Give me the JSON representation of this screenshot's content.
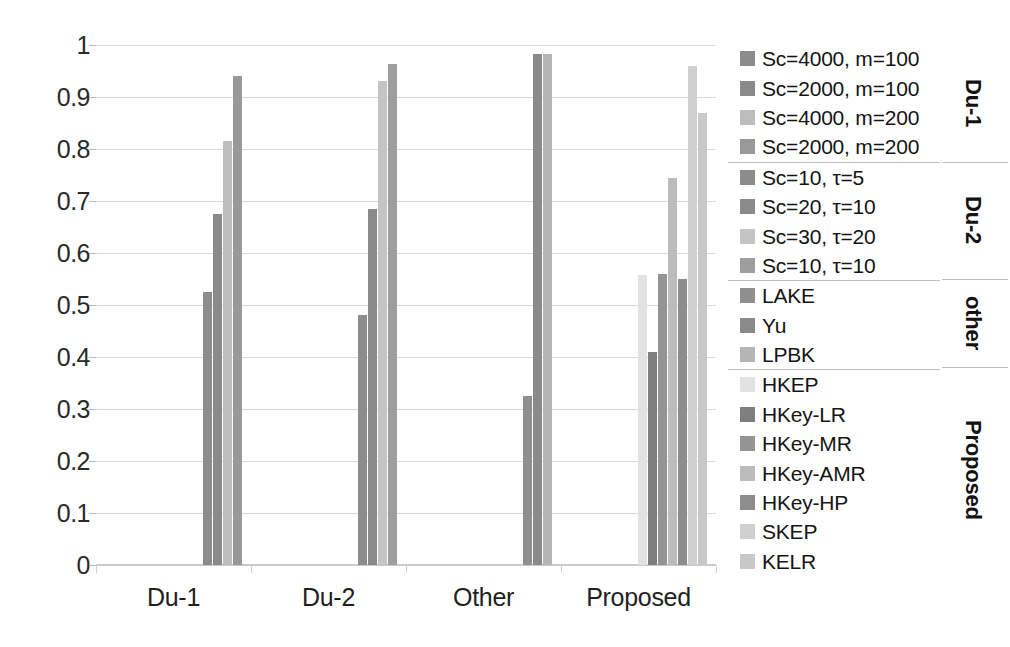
{
  "chart_data": {
    "type": "bar",
    "title": "",
    "xlabel": "",
    "ylabel": "",
    "ylim": [
      0,
      1
    ],
    "grid": true,
    "legend_position": "right",
    "categories": [
      "Du-1",
      "Du-2",
      "Other",
      "Proposed"
    ],
    "y_ticks": [
      "0",
      "0.1",
      "0.2",
      "0.3",
      "0.4",
      "0.5",
      "0.6",
      "0.7",
      "0.8",
      "0.9",
      "1"
    ],
    "y_tick_values": [
      0,
      0.1,
      0.2,
      0.3,
      0.4,
      0.5,
      0.6,
      0.7,
      0.8,
      0.9,
      1
    ],
    "series": [
      {
        "name": "Sc=4000, m=100",
        "group": "Du-1",
        "color": "#8c8c8c",
        "category": "Du-1",
        "value": 0.525
      },
      {
        "name": "Sc=2000, m=100",
        "group": "Du-1",
        "color": "#8a8a8a",
        "category": "Du-1",
        "value": 0.675
      },
      {
        "name": "Sc=4000, m=200",
        "group": "Du-1",
        "color": "#bdbdbd",
        "category": "Du-1",
        "value": 0.815
      },
      {
        "name": "Sc=2000, m=200",
        "group": "Du-1",
        "color": "#999999",
        "category": "Du-1",
        "value": 0.94
      },
      {
        "name": "Sc=10, τ=5",
        "group": "Du-2",
        "color": "#8c8c8c",
        "category": "Du-2",
        "value": 0.48
      },
      {
        "name": "Sc=20, τ=10",
        "group": "Du-2",
        "color": "#8a8a8a",
        "category": "Du-2",
        "value": 0.685
      },
      {
        "name": "Sc=30, τ=20",
        "group": "Du-2",
        "color": "#c4c4c4",
        "category": "Du-2",
        "value": 0.93
      },
      {
        "name": "Sc=10, τ=10",
        "group": "Du-2",
        "color": "#9e9e9e",
        "category": "Du-2",
        "value": 0.963
      },
      {
        "name": "LAKE",
        "group": "other",
        "color": "#8f8f8f",
        "category": "Other",
        "value": 0.325
      },
      {
        "name": "Yu",
        "group": "other",
        "color": "#8a8a8a",
        "category": "Other",
        "value": 0.982
      },
      {
        "name": "LPBK",
        "group": "other",
        "color": "#b5b5b5",
        "category": "Other",
        "value": 0.982
      },
      {
        "name": "HKEP",
        "group": "Proposed",
        "color": "#e2e2e2",
        "category": "Proposed",
        "value": 0.557
      },
      {
        "name": "HKey-LR",
        "group": "Proposed",
        "color": "#7e7e7e",
        "category": "Proposed",
        "value": 0.41
      },
      {
        "name": "HKey-MR",
        "group": "Proposed",
        "color": "#949494",
        "category": "Proposed",
        "value": 0.56
      },
      {
        "name": "HKey-AMR",
        "group": "Proposed",
        "color": "#bcbcbc",
        "category": "Proposed",
        "value": 0.745
      },
      {
        "name": "HKey-HP",
        "group": "Proposed",
        "color": "#8d8d8d",
        "category": "Proposed",
        "value": 0.55
      },
      {
        "name": "SKEP",
        "group": "Proposed",
        "color": "#cfcfcf",
        "category": "Proposed",
        "value": 0.96
      },
      {
        "name": "KELR",
        "group": "Proposed",
        "color": "#c8c8c8",
        "category": "Proposed",
        "value": 0.87
      }
    ]
  },
  "legend": {
    "blocks": [
      {
        "category": "Du-1",
        "items": [
          {
            "label": "Sc=4000, m=100",
            "color": "#8c8c8c"
          },
          {
            "label": "Sc=2000, m=100",
            "color": "#8a8a8a"
          },
          {
            "label": "Sc=4000, m=200",
            "color": "#bdbdbd"
          },
          {
            "label": "Sc=2000, m=200",
            "color": "#999999"
          }
        ]
      },
      {
        "category": "Du-2",
        "items": [
          {
            "label": "Sc=10, τ=5",
            "color": "#8c8c8c"
          },
          {
            "label": "Sc=20, τ=10",
            "color": "#8a8a8a"
          },
          {
            "label": "Sc=30, τ=20",
            "color": "#c4c4c4"
          },
          {
            "label": "Sc=10, τ=10",
            "color": "#9e9e9e"
          }
        ]
      },
      {
        "category": "other",
        "items": [
          {
            "label": "LAKE",
            "color": "#8f8f8f"
          },
          {
            "label": "Yu",
            "color": "#8a8a8a"
          },
          {
            "label": "LPBK",
            "color": "#b5b5b5"
          }
        ]
      },
      {
        "category": "Proposed",
        "items": [
          {
            "label": "HKEP",
            "color": "#e2e2e2"
          },
          {
            "label": "HKey-LR",
            "color": "#7e7e7e"
          },
          {
            "label": "HKey-MR",
            "color": "#949494"
          },
          {
            "label": "HKey-AMR",
            "color": "#bcbcbc"
          },
          {
            "label": "HKey-HP",
            "color": "#8d8d8d"
          },
          {
            "label": "SKEP",
            "color": "#cfcfcf"
          },
          {
            "label": "KELR",
            "color": "#c8c8c8"
          }
        ]
      }
    ]
  }
}
